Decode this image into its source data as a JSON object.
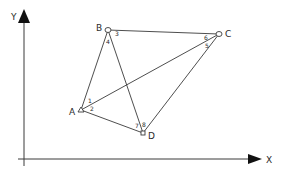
{
  "axes": {
    "x_label": "X",
    "y_label": "Y",
    "origin": [
      24,
      159
    ],
    "x_end": [
      262,
      159
    ],
    "y_end": [
      24,
      10
    ]
  },
  "points": [
    {
      "id": "A",
      "label": "A",
      "x": 81,
      "y": 110,
      "marker": "triangle"
    },
    {
      "id": "B",
      "label": "B",
      "x": 108,
      "y": 30,
      "marker": "circle"
    },
    {
      "id": "C",
      "label": "C",
      "x": 219,
      "y": 34,
      "marker": "circle"
    },
    {
      "id": "D",
      "label": "D",
      "x": 143,
      "y": 133,
      "marker": "square"
    }
  ],
  "edges": [
    [
      "A",
      "B"
    ],
    [
      "B",
      "C"
    ],
    [
      "B",
      "D"
    ],
    [
      "A",
      "C"
    ],
    [
      "C",
      "D"
    ],
    [
      "A",
      "D"
    ]
  ],
  "angle_labels": [
    {
      "text": "1",
      "x": 88,
      "y": 103
    },
    {
      "text": "2",
      "x": 90,
      "y": 111
    },
    {
      "text": "3",
      "x": 115,
      "y": 36
    },
    {
      "text": "4",
      "x": 106,
      "y": 44
    },
    {
      "text": "5",
      "x": 205,
      "y": 48
    },
    {
      "text": "6",
      "x": 204,
      "y": 40
    },
    {
      "text": "7",
      "x": 135,
      "y": 128
    },
    {
      "text": "8",
      "x": 142,
      "y": 127
    }
  ],
  "colors": {
    "line": "#3a3a3a",
    "axis": "#3a3a3a",
    "background": "#ffffff"
  }
}
